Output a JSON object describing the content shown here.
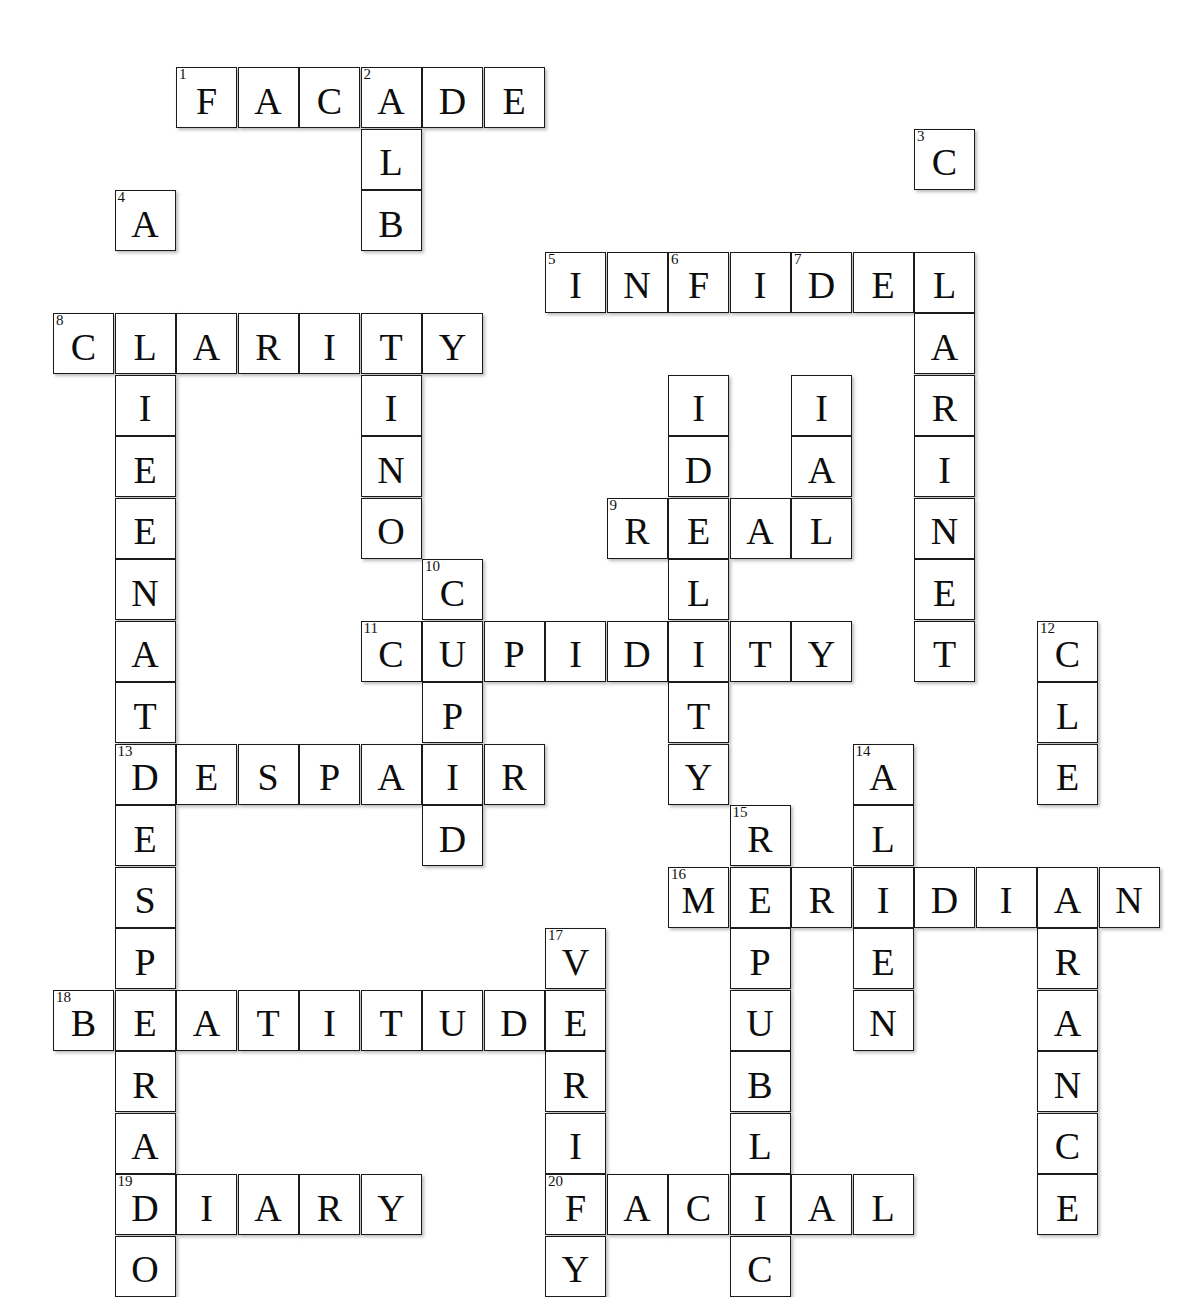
{
  "puzzle": {
    "type": "crossword",
    "title": "Crossword Puzzle Grid",
    "grid": {
      "cell_size": 61,
      "origin_x": 53,
      "origin_y": 67,
      "columns": 18,
      "rows": 18
    },
    "colors": {
      "cell_border": "#1a1a1a",
      "cell_fill": "#ffffff",
      "letter": "#0d0d0d",
      "page_background": "#ffffff"
    },
    "entries": [
      {
        "number": "1",
        "answer": "FACADE",
        "direction": "across",
        "row": 0,
        "col": 2
      },
      {
        "number": "2",
        "answer": "ALBINO",
        "direction": "down",
        "row": 0,
        "col": 5
      },
      {
        "number": "3",
        "answer": "CLARINET",
        "direction": "down",
        "row": 1,
        "col": 14
      },
      {
        "number": "4",
        "answer": "ALIENATE",
        "direction": "down",
        "row": 2,
        "col": 1
      },
      {
        "number": "5",
        "answer": "INFIDEL",
        "direction": "across",
        "row": 3,
        "col": 8
      },
      {
        "number": "6",
        "answer": "FIDELITY",
        "direction": "down",
        "row": 3,
        "col": 10
      },
      {
        "number": "7",
        "answer": "DIAL",
        "direction": "down",
        "row": 3,
        "col": 12
      },
      {
        "number": "8",
        "answer": "CLARITY",
        "direction": "across",
        "row": 4,
        "col": 0
      },
      {
        "number": "9",
        "answer": "REAL",
        "direction": "across",
        "row": 6,
        "col": 9
      },
      {
        "number": "10",
        "answer": "CUPID",
        "direction": "down",
        "row": 7,
        "col": 6
      },
      {
        "number": "11",
        "answer": "CUPIDITY",
        "direction": "across",
        "row": 8,
        "col": 5
      },
      {
        "number": "12",
        "answer": "CLEARANCE",
        "direction": "down",
        "row": 9,
        "col": 16
      },
      {
        "number": "13",
        "answer": "DESPAIR",
        "direction": "across",
        "row": 10,
        "col": 1
      },
      {
        "number": "13",
        "answer": "DESPERADO",
        "direction": "down",
        "row": 10,
        "col": 1
      },
      {
        "number": "14",
        "answer": "ALIEN",
        "direction": "down",
        "row": 10,
        "col": 13
      },
      {
        "number": "15",
        "answer": "REPUBLIC",
        "direction": "down",
        "row": 11,
        "col": 11
      },
      {
        "number": "16",
        "answer": "MERIDIAN",
        "direction": "across",
        "row": 12,
        "col": 10
      },
      {
        "number": "17",
        "answer": "VERIFY",
        "direction": "down",
        "row": 13,
        "col": 8
      },
      {
        "number": "18",
        "answer": "BEATITUDE",
        "direction": "across",
        "row": 14,
        "col": 0
      },
      {
        "number": "19",
        "answer": "DIARY",
        "direction": "across",
        "row": 16,
        "col": 1
      },
      {
        "number": "20",
        "answer": "FACIAL",
        "direction": "across",
        "row": 16,
        "col": 8
      }
    ],
    "cells": [
      {
        "r": 0,
        "c": 2,
        "l": "F",
        "n": "1"
      },
      {
        "r": 0,
        "c": 3,
        "l": "A",
        "n": ""
      },
      {
        "r": 0,
        "c": 4,
        "l": "C",
        "n": ""
      },
      {
        "r": 0,
        "c": 5,
        "l": "A",
        "n": "2"
      },
      {
        "r": 0,
        "c": 6,
        "l": "D",
        "n": ""
      },
      {
        "r": 0,
        "c": 7,
        "l": "E",
        "n": ""
      },
      {
        "r": 1,
        "c": 5,
        "l": "L",
        "n": ""
      },
      {
        "r": 1,
        "c": 14,
        "l": "C",
        "n": "3"
      },
      {
        "r": 2,
        "c": 1,
        "l": "A",
        "n": "4"
      },
      {
        "r": 2,
        "c": 5,
        "l": "B",
        "n": ""
      },
      {
        "r": 3,
        "c": 8,
        "l": "I",
        "n": "5"
      },
      {
        "r": 3,
        "c": 9,
        "l": "N",
        "n": ""
      },
      {
        "r": 3,
        "c": 10,
        "l": "F",
        "n": "6"
      },
      {
        "r": 3,
        "c": 11,
        "l": "I",
        "n": ""
      },
      {
        "r": 3,
        "c": 12,
        "l": "D",
        "n": "7"
      },
      {
        "r": 3,
        "c": 13,
        "l": "E",
        "n": ""
      },
      {
        "r": 3,
        "c": 14,
        "l": "L",
        "n": ""
      },
      {
        "r": 4,
        "c": 0,
        "l": "C",
        "n": "8"
      },
      {
        "r": 4,
        "c": 1,
        "l": "L",
        "n": ""
      },
      {
        "r": 4,
        "c": 2,
        "l": "A",
        "n": ""
      },
      {
        "r": 4,
        "c": 3,
        "l": "R",
        "n": ""
      },
      {
        "r": 4,
        "c": 4,
        "l": "I",
        "n": ""
      },
      {
        "r": 4,
        "c": 5,
        "l": "T",
        "n": ""
      },
      {
        "r": 4,
        "c": 6,
        "l": "Y",
        "n": ""
      },
      {
        "r": 4,
        "c": 14,
        "l": "A",
        "n": ""
      },
      {
        "r": 5,
        "c": 1,
        "l": "I",
        "n": ""
      },
      {
        "r": 5,
        "c": 5,
        "l": "I",
        "n": ""
      },
      {
        "r": 5,
        "c": 10,
        "l": "I",
        "n": ""
      },
      {
        "r": 5,
        "c": 12,
        "l": "I",
        "n": ""
      },
      {
        "r": 5,
        "c": 14,
        "l": "R",
        "n": ""
      },
      {
        "r": 6,
        "c": 1,
        "l": "E",
        "n": ""
      },
      {
        "r": 6,
        "c": 5,
        "l": "N",
        "n": ""
      },
      {
        "r": 6,
        "c": 10,
        "l": "D",
        "n": ""
      },
      {
        "r": 6,
        "c": 12,
        "l": "A",
        "n": ""
      },
      {
        "r": 6,
        "c": 14,
        "l": "I",
        "n": ""
      },
      {
        "r": 7,
        "c": 1,
        "l": "E",
        "n": ""
      },
      {
        "r": 7,
        "c": 5,
        "l": "O",
        "n": ""
      },
      {
        "r": 7,
        "c": 9,
        "l": "R",
        "n": "9"
      },
      {
        "r": 7,
        "c": 10,
        "l": "E",
        "n": ""
      },
      {
        "r": 7,
        "c": 11,
        "l": "A",
        "n": ""
      },
      {
        "r": 7,
        "c": 12,
        "l": "L",
        "n": ""
      },
      {
        "r": 7,
        "c": 14,
        "l": "N",
        "n": ""
      },
      {
        "r": 8,
        "c": 1,
        "l": "N",
        "n": ""
      },
      {
        "r": 8,
        "c": 6,
        "l": "C",
        "n": "10"
      },
      {
        "r": 8,
        "c": 10,
        "l": "L",
        "n": ""
      },
      {
        "r": 8,
        "c": 14,
        "l": "E",
        "n": ""
      },
      {
        "r": 9,
        "c": 1,
        "l": "A",
        "n": ""
      },
      {
        "r": 9,
        "c": 5,
        "l": "C",
        "n": "11"
      },
      {
        "r": 9,
        "c": 6,
        "l": "U",
        "n": ""
      },
      {
        "r": 9,
        "c": 7,
        "l": "P",
        "n": ""
      },
      {
        "r": 9,
        "c": 8,
        "l": "I",
        "n": ""
      },
      {
        "r": 9,
        "c": 9,
        "l": "D",
        "n": ""
      },
      {
        "r": 9,
        "c": 10,
        "l": "I",
        "n": ""
      },
      {
        "r": 9,
        "c": 11,
        "l": "T",
        "n": ""
      },
      {
        "r": 9,
        "c": 12,
        "l": "Y",
        "n": ""
      },
      {
        "r": 9,
        "c": 14,
        "l": "T",
        "n": ""
      },
      {
        "r": 9,
        "c": 16,
        "l": "C",
        "n": "12"
      },
      {
        "r": 10,
        "c": 1,
        "l": "T",
        "n": ""
      },
      {
        "r": 10,
        "c": 6,
        "l": "P",
        "n": ""
      },
      {
        "r": 10,
        "c": 10,
        "l": "T",
        "n": ""
      },
      {
        "r": 10,
        "c": 16,
        "l": "L",
        "n": ""
      },
      {
        "r": 11,
        "c": 1,
        "l": "D",
        "n": "13"
      },
      {
        "r": 11,
        "c": 2,
        "l": "E",
        "n": ""
      },
      {
        "r": 11,
        "c": 3,
        "l": "S",
        "n": ""
      },
      {
        "r": 11,
        "c": 4,
        "l": "P",
        "n": ""
      },
      {
        "r": 11,
        "c": 5,
        "l": "A",
        "n": ""
      },
      {
        "r": 11,
        "c": 6,
        "l": "I",
        "n": ""
      },
      {
        "r": 11,
        "c": 7,
        "l": "R",
        "n": ""
      },
      {
        "r": 11,
        "c": 10,
        "l": "Y",
        "n": ""
      },
      {
        "r": 11,
        "c": 13,
        "l": "A",
        "n": "14"
      },
      {
        "r": 11,
        "c": 16,
        "l": "E",
        "n": ""
      },
      {
        "r": 12,
        "c": 1,
        "l": "E",
        "n": ""
      },
      {
        "r": 12,
        "c": 6,
        "l": "D",
        "n": ""
      },
      {
        "r": 12,
        "c": 11,
        "l": "R",
        "n": "15"
      },
      {
        "r": 12,
        "c": 13,
        "l": "L",
        "n": ""
      },
      {
        "r": 13,
        "c": 1,
        "l": "S",
        "n": ""
      },
      {
        "r": 13,
        "c": 10,
        "l": "M",
        "n": "16"
      },
      {
        "r": 13,
        "c": 11,
        "l": "E",
        "n": ""
      },
      {
        "r": 13,
        "c": 12,
        "l": "R",
        "n": ""
      },
      {
        "r": 13,
        "c": 13,
        "l": "I",
        "n": ""
      },
      {
        "r": 13,
        "c": 14,
        "l": "D",
        "n": ""
      },
      {
        "r": 13,
        "c": 15,
        "l": "I",
        "n": ""
      },
      {
        "r": 13,
        "c": 16,
        "l": "A",
        "n": ""
      },
      {
        "r": 13,
        "c": 17,
        "l": "N",
        "n": ""
      },
      {
        "r": 14,
        "c": 1,
        "l": "P",
        "n": ""
      },
      {
        "r": 14,
        "c": 8,
        "l": "V",
        "n": "17"
      },
      {
        "r": 14,
        "c": 11,
        "l": "P",
        "n": ""
      },
      {
        "r": 14,
        "c": 13,
        "l": "E",
        "n": ""
      },
      {
        "r": 14,
        "c": 16,
        "l": "R",
        "n": ""
      },
      {
        "r": 15,
        "c": 0,
        "l": "B",
        "n": "18"
      },
      {
        "r": 15,
        "c": 1,
        "l": "E",
        "n": ""
      },
      {
        "r": 15,
        "c": 2,
        "l": "A",
        "n": ""
      },
      {
        "r": 15,
        "c": 3,
        "l": "T",
        "n": ""
      },
      {
        "r": 15,
        "c": 4,
        "l": "I",
        "n": ""
      },
      {
        "r": 15,
        "c": 5,
        "l": "T",
        "n": ""
      },
      {
        "r": 15,
        "c": 6,
        "l": "U",
        "n": ""
      },
      {
        "r": 15,
        "c": 7,
        "l": "D",
        "n": ""
      },
      {
        "r": 15,
        "c": 8,
        "l": "E",
        "n": ""
      },
      {
        "r": 15,
        "c": 11,
        "l": "U",
        "n": ""
      },
      {
        "r": 15,
        "c": 13,
        "l": "N",
        "n": ""
      },
      {
        "r": 15,
        "c": 16,
        "l": "A",
        "n": ""
      },
      {
        "r": 16,
        "c": 1,
        "l": "R",
        "n": ""
      },
      {
        "r": 16,
        "c": 8,
        "l": "R",
        "n": ""
      },
      {
        "r": 16,
        "c": 11,
        "l": "B",
        "n": ""
      },
      {
        "r": 16,
        "c": 16,
        "l": "N",
        "n": ""
      },
      {
        "r": 17,
        "c": 1,
        "l": "A",
        "n": ""
      },
      {
        "r": 17,
        "c": 8,
        "l": "I",
        "n": ""
      },
      {
        "r": 17,
        "c": 11,
        "l": "L",
        "n": ""
      },
      {
        "r": 17,
        "c": 16,
        "l": "C",
        "n": ""
      },
      {
        "r": 18,
        "c": 1,
        "l": "D",
        "n": "19"
      },
      {
        "r": 18,
        "c": 2,
        "l": "I",
        "n": ""
      },
      {
        "r": 18,
        "c": 3,
        "l": "A",
        "n": ""
      },
      {
        "r": 18,
        "c": 4,
        "l": "R",
        "n": ""
      },
      {
        "r": 18,
        "c": 5,
        "l": "Y",
        "n": ""
      },
      {
        "r": 18,
        "c": 8,
        "l": "F",
        "n": "20"
      },
      {
        "r": 18,
        "c": 9,
        "l": "A",
        "n": ""
      },
      {
        "r": 18,
        "c": 10,
        "l": "C",
        "n": ""
      },
      {
        "r": 18,
        "c": 11,
        "l": "I",
        "n": ""
      },
      {
        "r": 18,
        "c": 12,
        "l": "A",
        "n": ""
      },
      {
        "r": 18,
        "c": 13,
        "l": "L",
        "n": ""
      },
      {
        "r": 18,
        "c": 16,
        "l": "E",
        "n": ""
      },
      {
        "r": 19,
        "c": 1,
        "l": "O",
        "n": ""
      },
      {
        "r": 19,
        "c": 8,
        "l": "Y",
        "n": ""
      },
      {
        "r": 19,
        "c": 11,
        "l": "C",
        "n": ""
      }
    ]
  }
}
